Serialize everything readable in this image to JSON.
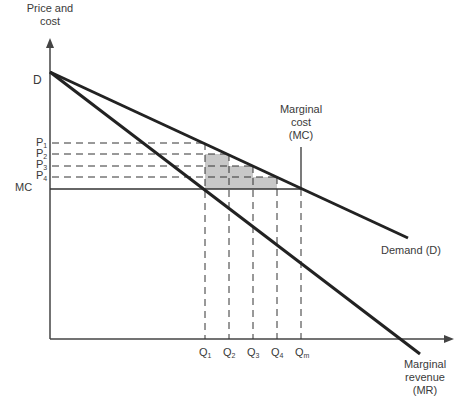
{
  "diagram": {
    "y_axis_label": [
      "Price and",
      "cost"
    ],
    "x_axis_label": "",
    "y_labels": {
      "D": "D",
      "P1": "P",
      "P1_sub": "1",
      "P2": "P",
      "P2_sub": "2",
      "P3": "P",
      "P3_sub": "3",
      "P4": "P",
      "P4_sub": "4",
      "MC": "MC"
    },
    "x_labels": {
      "Q1": "Q",
      "Q1_sub": "1",
      "Q2": "Q",
      "Q2_sub": "2",
      "Q3": "Q",
      "Q3_sub": "3",
      "Q4": "Q",
      "Q4_sub": "4",
      "Qm": "Q",
      "Qm_sub": "m"
    },
    "curve_labels": {
      "mc": [
        "Marginal",
        "cost",
        "(MC)"
      ],
      "demand": "Demand (D)",
      "mr": [
        "Marginal",
        "revenue",
        "(MR)"
      ]
    },
    "colors": {
      "line": "#222222",
      "shade": "#c8c8c8",
      "text": "#3a3a3a"
    }
  }
}
